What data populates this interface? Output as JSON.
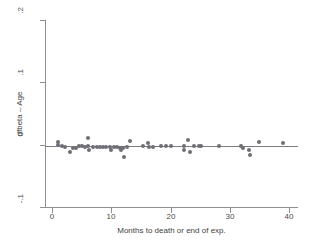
{
  "chart_data": {
    "type": "scatter",
    "title": "",
    "xlabel": "Months to death or end of exp.",
    "ylabel": "dfbeta – Age",
    "xlim": [
      -1.2,
      41.5
    ],
    "ylim": [
      -0.1,
      0.2
    ],
    "xticks": [
      0,
      10,
      20,
      30,
      40
    ],
    "xticklabels": [
      "0",
      "10",
      "20",
      "30",
      "40"
    ],
    "yticks": [
      -0.1,
      0,
      0.1,
      0.2
    ],
    "yticklabels": [
      "-.1",
      "0",
      ".1",
      ".2"
    ],
    "grid": false,
    "legend": null,
    "reference_lines": [
      {
        "axis": "y",
        "value": 0
      }
    ],
    "marker_color": "#6e6e76",
    "axis_color": "#8f8f92",
    "background": "#ffffff",
    "series": [
      {
        "name": "dfbeta Age",
        "points": [
          {
            "x": 1.0,
            "y": 0.004
          },
          {
            "x": 1.0,
            "y": -0.001
          },
          {
            "x": 1.6,
            "y": -0.002
          },
          {
            "x": 2.2,
            "y": -0.003
          },
          {
            "x": 3.0,
            "y": -0.012
          },
          {
            "x": 3.5,
            "y": -0.006
          },
          {
            "x": 4.1,
            "y": -0.005
          },
          {
            "x": 4.6,
            "y": -0.002
          },
          {
            "x": 5.1,
            "y": -0.002
          },
          {
            "x": 5.6,
            "y": -0.003
          },
          {
            "x": 6.0,
            "y": 0.01
          },
          {
            "x": 6.1,
            "y": -0.002
          },
          {
            "x": 6.3,
            "y": -0.008
          },
          {
            "x": 6.9,
            "y": -0.003
          },
          {
            "x": 7.5,
            "y": -0.003
          },
          {
            "x": 8.1,
            "y": -0.003
          },
          {
            "x": 8.6,
            "y": -0.004
          },
          {
            "x": 9.1,
            "y": -0.004
          },
          {
            "x": 9.7,
            "y": -0.004
          },
          {
            "x": 10.0,
            "y": -0.008
          },
          {
            "x": 10.4,
            "y": -0.004
          },
          {
            "x": 11.0,
            "y": -0.004
          },
          {
            "x": 11.5,
            "y": -0.005
          },
          {
            "x": 11.7,
            "y": -0.009
          },
          {
            "x": 12.0,
            "y": -0.006
          },
          {
            "x": 12.1,
            "y": -0.019
          },
          {
            "x": 12.6,
            "y": -0.004
          },
          {
            "x": 13.2,
            "y": 0.006
          },
          {
            "x": 15.4,
            "y": -0.002
          },
          {
            "x": 16.1,
            "y": 0.002
          },
          {
            "x": 16.3,
            "y": -0.003
          },
          {
            "x": 17.0,
            "y": -0.003
          },
          {
            "x": 18.4,
            "y": -0.002
          },
          {
            "x": 19.2,
            "y": -0.002
          },
          {
            "x": 20.0,
            "y": -0.002
          },
          {
            "x": 22.2,
            "y": -0.002
          },
          {
            "x": 22.3,
            "y": -0.008
          },
          {
            "x": 23.0,
            "y": 0.008
          },
          {
            "x": 23.2,
            "y": -0.012
          },
          {
            "x": 24.0,
            "y": -0.002
          },
          {
            "x": 24.8,
            "y": -0.002
          },
          {
            "x": 25.2,
            "y": -0.002
          },
          {
            "x": 28.1,
            "y": -0.002
          },
          {
            "x": 31.8,
            "y": -0.002
          },
          {
            "x": 32.3,
            "y": -0.006
          },
          {
            "x": 33.2,
            "y": -0.009
          },
          {
            "x": 33.4,
            "y": -0.016
          },
          {
            "x": 35.0,
            "y": 0.004
          },
          {
            "x": 39.0,
            "y": 0.003
          }
        ]
      }
    ]
  }
}
